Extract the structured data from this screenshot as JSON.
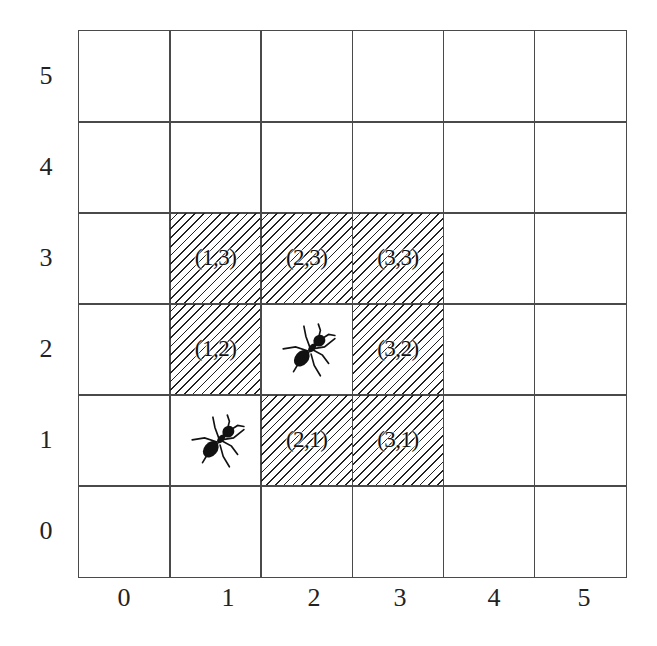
{
  "figure": {
    "type": "grid-diagram",
    "rows": 6,
    "cols": 6,
    "x_axis_labels": [
      "0",
      "1",
      "2",
      "3",
      "4",
      "5"
    ],
    "y_axis_labels": [
      "5",
      "4",
      "3",
      "2",
      "1",
      "0"
    ],
    "line_color": "#4a4a4a",
    "hatch_color": "#222222",
    "hatched_cells": [
      {
        "x": 1,
        "y": 3,
        "label": "(1,3)"
      },
      {
        "x": 2,
        "y": 3,
        "label": "(2,3)"
      },
      {
        "x": 3,
        "y": 3,
        "label": "(3,3)"
      },
      {
        "x": 1,
        "y": 2,
        "label": "(1,2)"
      },
      {
        "x": 3,
        "y": 2,
        "label": "(3,2)"
      },
      {
        "x": 2,
        "y": 1,
        "label": "(2,1)"
      },
      {
        "x": 3,
        "y": 1,
        "label": "(3,1)"
      }
    ],
    "ants": [
      {
        "x": 2,
        "y": 2,
        "icon": "ant-icon"
      },
      {
        "x": 1,
        "y": 1,
        "icon": "ant-icon"
      }
    ]
  }
}
